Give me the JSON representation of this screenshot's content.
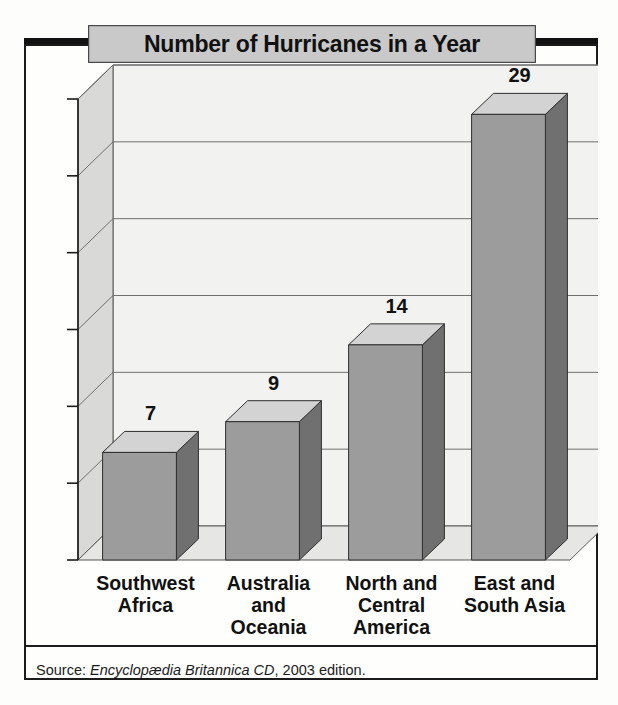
{
  "chart_data": {
    "type": "bar",
    "title": "Number of Hurricanes in a Year",
    "xlabel": "",
    "ylabel": "",
    "categories": [
      "Southwest\nAfrica",
      "Australia\nand\nOceania",
      "North and\nCentral\nAmerica",
      "East and\nSouth Asia"
    ],
    "values": [
      7,
      9,
      14,
      29
    ],
    "value_labels": [
      "7",
      "9",
      "14",
      "29"
    ],
    "ylim": [
      0,
      30
    ],
    "yticks": [
      30,
      25,
      20,
      15,
      10,
      5,
      0
    ],
    "ytick_labels": [
      "30",
      "25",
      "20",
      "15",
      "10",
      "5",
      "0"
    ],
    "grid": true,
    "legend": false,
    "style": "3d-column",
    "colors": {
      "bar_front": "#9c9c9c",
      "bar_top": "#d3d3d3",
      "bar_side": "#707070",
      "plot_back": "#f2f2f0",
      "plot_wall": "#d9d9d7",
      "plot_floor": "#e6e6e4",
      "gridline": "#6f6f6f",
      "outline": "#1b1b1b",
      "title_plate": "#c9c9c9"
    }
  },
  "source": {
    "prefix": "Source: ",
    "title": "Encyclopædia Britannica CD",
    "suffix": ", 2003 edition."
  }
}
